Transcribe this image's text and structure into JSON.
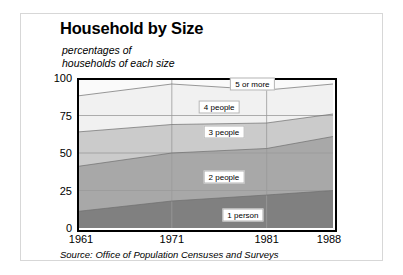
{
  "title": "Household by Size",
  "subtitle": "percentages of\nhouseholds of each size",
  "source": "Source: Office of Population Censuses and Surveys",
  "chart_data": {
    "type": "area",
    "stacked": true,
    "title": "Household by Size",
    "subtitle": "percentages of households of each size",
    "xlabel": "",
    "ylabel": "",
    "x": [
      1961,
      1971,
      1981,
      1988
    ],
    "categories": [
      "1961",
      "1971",
      "1981",
      "1988"
    ],
    "xlim": [
      1961,
      1988
    ],
    "ylim": [
      0,
      100
    ],
    "yticks": [
      0,
      25,
      50,
      75,
      100
    ],
    "ytick_labels": [
      "0",
      "25",
      "50",
      "75",
      "100"
    ],
    "xticks": [
      1961,
      1971,
      1981,
      1988
    ],
    "xtick_labels": [
      "1961",
      "1971",
      "1981",
      "1988"
    ],
    "grid": true,
    "legend": "inline-labels",
    "series": [
      {
        "name": "1 person",
        "label": "1 person",
        "color": "#808080",
        "values": [
          11,
          18,
          22,
          25
        ],
        "cumulative": [
          11,
          18,
          22,
          25
        ],
        "label_x": 1978.5,
        "label_y": 9
      },
      {
        "name": "2 people",
        "label": "2 people",
        "color": "#a8a8a8",
        "values": [
          30,
          32,
          31,
          36
        ],
        "cumulative": [
          41,
          50,
          53,
          61
        ],
        "label_x": 1976.5,
        "label_y": 34
      },
      {
        "name": "3 people",
        "label": "3 people",
        "color": "#cbcbcb",
        "values": [
          23,
          19,
          17,
          15
        ],
        "cumulative": [
          64,
          69,
          70,
          76
        ],
        "label_x": 1976.5,
        "label_y": 64
      },
      {
        "name": "4 people",
        "label": "4 people",
        "color": "#f1f1f1",
        "values": [
          24,
          27,
          22,
          20
        ],
        "cumulative": [
          88,
          96,
          92,
          96
        ],
        "label_x": 1976.0,
        "label_y": 81
      },
      {
        "name": "5 or more",
        "label": "5 or more",
        "color": "#fafafa",
        "values": [
          12,
          4,
          8,
          4
        ],
        "cumulative": [
          100,
          100,
          100,
          100
        ],
        "label_x": 1979.5,
        "label_y": 96
      }
    ]
  },
  "axes": {
    "y_ticks": [
      "100",
      "75",
      "50",
      "25",
      "0"
    ],
    "x_ticks": [
      "1961",
      "1971",
      "1981",
      "1988"
    ]
  },
  "colors": {
    "page_background": "#ffffff",
    "card_border": "#d7d7d7",
    "frame": "#000000",
    "gridline": "#9a9a9a",
    "text": "#000000"
  }
}
